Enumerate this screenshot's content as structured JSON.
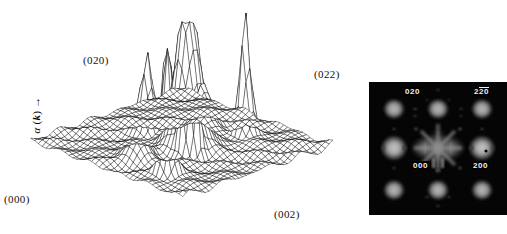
{
  "figure": {
    "kind": "two-panel scientific figure",
    "panels": [
      "3d-wireframe-surface-plot",
      "electron-diffraction-pattern"
    ]
  },
  "surface": {
    "axis_label": {
      "symbol": "α",
      "variable": "k",
      "open_paren": "(",
      "close_paren": ")",
      "arrow": "→",
      "full": "α (k) →"
    },
    "corner_labels": [
      {
        "id": "origin",
        "text": "(000)"
      },
      {
        "id": "back-left",
        "text": "(020)"
      },
      {
        "id": "back-right",
        "text": "(022)"
      },
      {
        "id": "front-right",
        "text": "(002)"
      }
    ],
    "render": {
      "line_color": "#0a0a0a",
      "fill_color": "#ffffff",
      "baseline_fill": "#2b2b2b"
    }
  },
  "diffraction": {
    "background": "#050505",
    "spot_labels": [
      {
        "id": "020",
        "text": "020",
        "overbar": false
      },
      {
        "id": "2-20",
        "text": "20",
        "prefix": "2",
        "overbar": true
      },
      {
        "id": "000",
        "text": "000",
        "overbar": false
      },
      {
        "id": "200",
        "text": "200",
        "overbar": false
      }
    ]
  },
  "chart_data": {
    "type": "surface",
    "title": "",
    "xlabel": "",
    "ylabel": "α (k)",
    "zlabel": "",
    "grid": true,
    "legend": false,
    "axis_corner_indices": [
      "(000)",
      "(020)",
      "(022)",
      "(002)"
    ],
    "nx": 41,
    "nz": 41,
    "zlim": [
      0,
      1
    ],
    "clipped_at_max": true,
    "peaks": [
      {
        "label": "central-truncated",
        "u": 0.5,
        "v": 0.46,
        "height": 1.0,
        "width": 0.085,
        "clipped": true
      },
      {
        "label": "near-020",
        "u": 0.16,
        "v": 0.26,
        "height": 0.74,
        "width": 0.045
      },
      {
        "label": "near-020-b",
        "u": 0.2,
        "v": 0.3,
        "height": 0.62,
        "width": 0.04
      },
      {
        "label": "mid-left-ridge",
        "u": 0.4,
        "v": 0.38,
        "height": 0.66,
        "width": 0.03
      },
      {
        "label": "mid-left-ridge-b",
        "u": 0.43,
        "v": 0.34,
        "height": 0.58,
        "width": 0.03
      },
      {
        "label": "near-022",
        "u": 0.8,
        "v": 0.38,
        "height": 0.7,
        "width": 0.04
      },
      {
        "label": "front-centre",
        "u": 0.47,
        "v": 0.7,
        "height": 0.45,
        "width": 0.05
      },
      {
        "label": "low-left-shoulder",
        "u": 0.22,
        "v": 0.52,
        "height": 0.28,
        "width": 0.07
      },
      {
        "label": "low-right-shoulder",
        "u": 0.72,
        "v": 0.58,
        "height": 0.26,
        "width": 0.07
      }
    ],
    "baseline_level": 0.06,
    "second_panel": {
      "type": "image",
      "name": "electron-diffraction-pattern",
      "indexed_spots": [
        "020",
        "2̂0",
        "000",
        "200"
      ],
      "lattice_spots_visible": 9,
      "diffuse_streaks": true
    }
  }
}
